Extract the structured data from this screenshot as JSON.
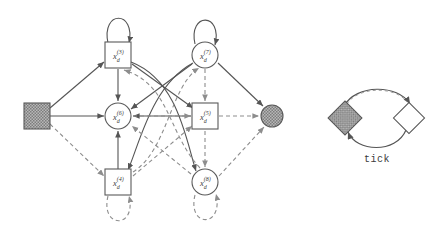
{
  "figure": {
    "kind": "directed-graph-diagram",
    "background": "#ffffff",
    "solid_edge_color": "#555555",
    "dashed_edge_color": "#8d8d8d",
    "node_stroke": "#5a5a5a",
    "node_fill": "#ffffff",
    "hatched_fill": "#a9a9a9"
  },
  "nodes": [
    {
      "id": "src",
      "label_base": "x",
      "label_sub": "d",
      "label_sup": "(1)",
      "shape": "square-hatched",
      "cx": 37,
      "cy": 116,
      "size": 26,
      "show_label": false
    },
    {
      "id": "n3",
      "label_base": "x",
      "label_sub": "d",
      "label_sup": "(3)",
      "shape": "square",
      "cx": 118,
      "cy": 55,
      "size": 26,
      "show_label": true
    },
    {
      "id": "n6",
      "label_base": "x",
      "label_sub": "d",
      "label_sup": "(6)",
      "shape": "circle",
      "cx": 118,
      "cy": 116,
      "size": 26,
      "show_label": true
    },
    {
      "id": "n4",
      "label_base": "x",
      "label_sub": "d",
      "label_sup": "(4)",
      "shape": "square",
      "cx": 118,
      "cy": 182,
      "size": 26,
      "show_label": true
    },
    {
      "id": "n7",
      "label_base": "x",
      "label_sub": "d",
      "label_sup": "(7)",
      "shape": "circle",
      "cx": 205,
      "cy": 55,
      "size": 26,
      "show_label": true
    },
    {
      "id": "n5",
      "label_base": "x",
      "label_sub": "d",
      "label_sup": "(5)",
      "shape": "square",
      "cx": 205,
      "cy": 116,
      "size": 26,
      "show_label": true
    },
    {
      "id": "n8",
      "label_base": "x",
      "label_sub": "d",
      "label_sup": "(8)",
      "shape": "circle",
      "cx": 205,
      "cy": 182,
      "size": 26,
      "show_label": true
    },
    {
      "id": "sink",
      "label_base": "x",
      "label_sub": "d",
      "label_sup": "(2)",
      "shape": "circle-hatched",
      "cx": 272,
      "cy": 116,
      "size": 22,
      "show_label": false
    }
  ],
  "edges": [
    {
      "from": "src",
      "to": "n3",
      "style": "solid"
    },
    {
      "from": "src",
      "to": "n6",
      "style": "solid"
    },
    {
      "from": "src",
      "to": "n4",
      "style": "dashed"
    },
    {
      "from": "n3",
      "to": "n3",
      "style": "solid",
      "self_loop": "top"
    },
    {
      "from": "n7",
      "to": "n7",
      "style": "solid",
      "self_loop": "top"
    },
    {
      "from": "n4",
      "to": "n4",
      "style": "dashed",
      "self_loop": "bottom"
    },
    {
      "from": "n8",
      "to": "n8",
      "style": "dashed",
      "self_loop": "bottom"
    },
    {
      "from": "n3",
      "to": "n6",
      "style": "solid"
    },
    {
      "from": "n4",
      "to": "n6",
      "style": "solid"
    },
    {
      "from": "n7",
      "to": "n5",
      "style": "dashed"
    },
    {
      "from": "n5",
      "to": "n8",
      "style": "dashed"
    },
    {
      "from": "n6",
      "to": "n5",
      "style": "dashed"
    },
    {
      "from": "n5",
      "to": "n6",
      "style": "solid"
    },
    {
      "from": "n3",
      "to": "n8",
      "style": "solid",
      "curve": "right"
    },
    {
      "from": "n8",
      "to": "n3",
      "style": "dashed",
      "curve": "right"
    },
    {
      "from": "n7",
      "to": "n4",
      "style": "solid",
      "curve": "left"
    },
    {
      "from": "n4",
      "to": "n7",
      "style": "dashed",
      "curve": "left"
    },
    {
      "from": "n3",
      "to": "n5",
      "style": "solid",
      "crossing": true
    },
    {
      "from": "n7",
      "to": "n6",
      "style": "solid",
      "crossing": true
    },
    {
      "from": "n4",
      "to": "n5",
      "style": "dashed",
      "crossing": true
    },
    {
      "from": "n8",
      "to": "n6",
      "style": "dashed",
      "crossing": true
    },
    {
      "from": "n5",
      "to": "sink",
      "style": "dashed"
    },
    {
      "from": "n7",
      "to": "sink",
      "style": "solid"
    },
    {
      "from": "n8",
      "to": "sink",
      "style": "dashed"
    }
  ],
  "legend": {
    "label": "tick",
    "from_shape": "diamond-hatched",
    "to_shape": "diamond-open",
    "top_arrow_style": "solid-with-dashed-overlay",
    "bottom_arrow_style": "solid"
  }
}
